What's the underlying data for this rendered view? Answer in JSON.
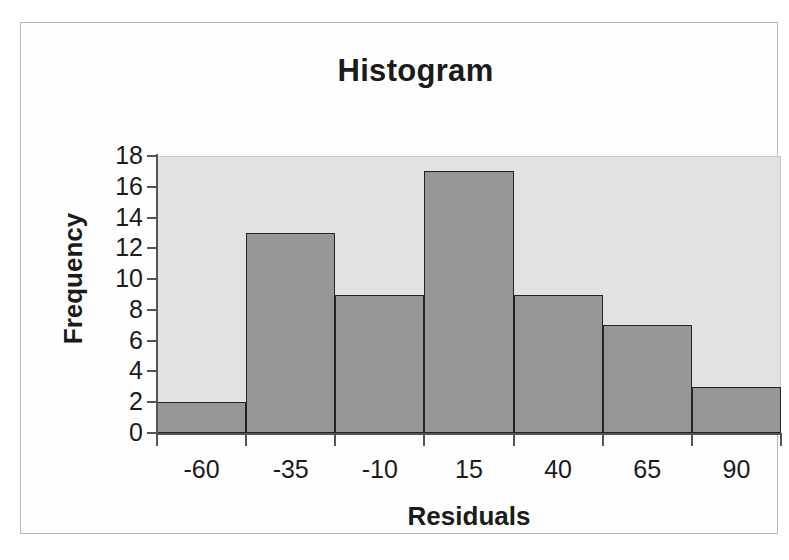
{
  "chart_data": {
    "type": "bar",
    "title": "Histogram",
    "xlabel": "Residuals",
    "ylabel": "Frequency",
    "categories": [
      "-60",
      "-35",
      "-10",
      "15",
      "40",
      "65",
      "90"
    ],
    "values": [
      2,
      13,
      9,
      17,
      9,
      7,
      3
    ],
    "ylim": [
      0,
      18
    ],
    "y_ticks": [
      0,
      2,
      4,
      6,
      8,
      10,
      12,
      14,
      16,
      18
    ],
    "y_tick_labels": [
      "0",
      "2",
      "4",
      "6",
      "8",
      "10",
      "12",
      "14",
      "16",
      "18"
    ],
    "grid": false,
    "legend": null,
    "bar_color": "#979797",
    "bar_border_color": "#242424",
    "plot_background": "#e2e2e2",
    "figure_background": "#ffffff",
    "text_color": "#1b1b1b",
    "axis_color": "#545454"
  },
  "figure": {
    "title": "Histogram",
    "x_axis_title": "Residuals",
    "y_axis_title": "Frequency"
  }
}
